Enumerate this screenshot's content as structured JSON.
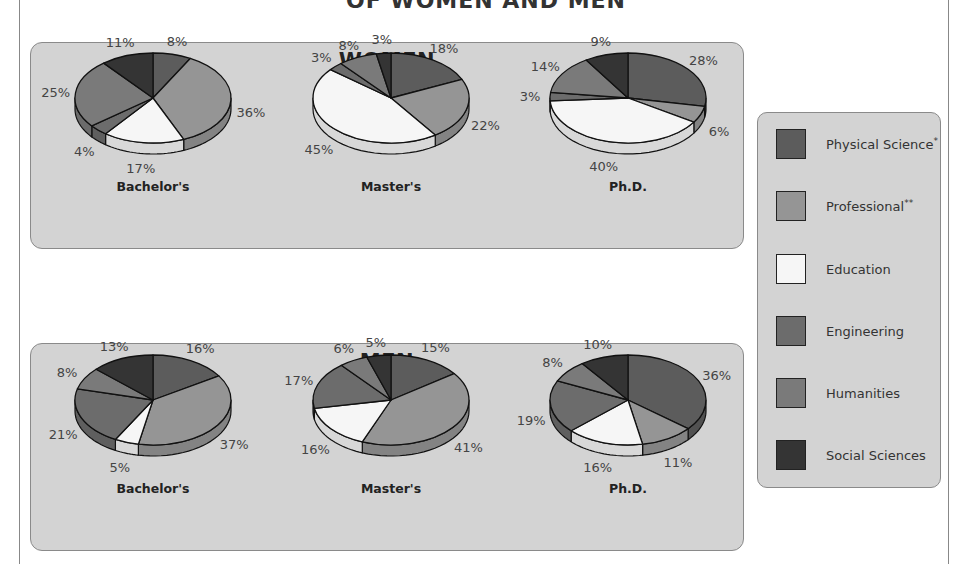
{
  "title": "OF WOMEN AND MEN",
  "colors": {
    "Physical Science": "#5c5c5c",
    "Professional": "#959595",
    "Education": "#f6f6f6",
    "Engineering": "#6c6c6c",
    "Humanities": "#7a7a7a",
    "Social Sciences": "#343434",
    "panel_bg": "#d3d3d3"
  },
  "legend": {
    "items": [
      {
        "label": "Physical Science",
        "mark": "*"
      },
      {
        "label": "Professional",
        "mark": "**"
      },
      {
        "label": "Education",
        "mark": ""
      },
      {
        "label": "Engineering",
        "mark": ""
      },
      {
        "label": "Humanities",
        "mark": ""
      },
      {
        "label": "Social Sciences",
        "mark": ""
      }
    ]
  },
  "panels": {
    "women": {
      "title": "WOMEN"
    },
    "men": {
      "title": "MEN"
    }
  },
  "chart_data": [
    {
      "type": "pie",
      "title": "WOMEN — Bachelor's",
      "group": "WOMEN",
      "degree": "Bachelor's",
      "categories": [
        "Physical Science",
        "Professional",
        "Education",
        "Engineering",
        "Humanities",
        "Social Sciences"
      ],
      "values": [
        8,
        36,
        17,
        4,
        25,
        11
      ]
    },
    {
      "type": "pie",
      "title": "WOMEN — Master's",
      "group": "WOMEN",
      "degree": "Master's",
      "categories": [
        "Physical Science",
        "Professional",
        "Education",
        "Engineering",
        "Humanities",
        "Social Sciences"
      ],
      "values": [
        18,
        22,
        45,
        3,
        8,
        3
      ]
    },
    {
      "type": "pie",
      "title": "WOMEN — Ph.D.",
      "group": "WOMEN",
      "degree": "Ph.D.",
      "categories": [
        "Physical Science",
        "Professional",
        "Education",
        "Engineering",
        "Humanities",
        "Social Sciences"
      ],
      "values": [
        28,
        6,
        40,
        3,
        14,
        9
      ]
    },
    {
      "type": "pie",
      "title": "MEN — Bachelor's",
      "group": "MEN",
      "degree": "Bachelor's",
      "categories": [
        "Physical Science",
        "Professional",
        "Education",
        "Engineering",
        "Humanities",
        "Social Sciences"
      ],
      "values": [
        16,
        37,
        5,
        21,
        8,
        13
      ]
    },
    {
      "type": "pie",
      "title": "MEN — Master's",
      "group": "MEN",
      "degree": "Master's",
      "categories": [
        "Physical Science",
        "Professional",
        "Education",
        "Engineering",
        "Humanities",
        "Social Sciences"
      ],
      "values": [
        15,
        41,
        16,
        17,
        6,
        5
      ]
    },
    {
      "type": "pie",
      "title": "MEN — Ph.D.",
      "group": "MEN",
      "degree": "Ph.D.",
      "categories": [
        "Physical Science",
        "Professional",
        "Education",
        "Engineering",
        "Humanities",
        "Social Sciences"
      ],
      "values": [
        36,
        11,
        16,
        19,
        8,
        10
      ]
    }
  ]
}
